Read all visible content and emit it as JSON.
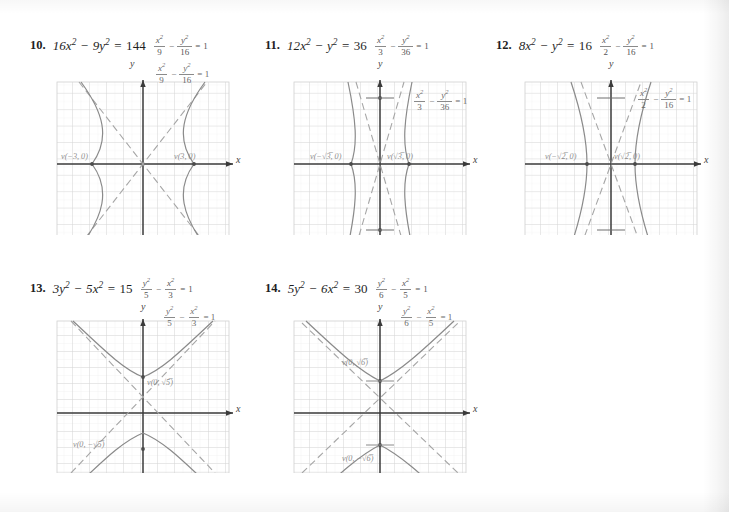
{
  "page": {
    "background": "#ffffff",
    "ink": "#2a2a2a",
    "grid_color": "#d8d8d8",
    "grid_minor_color": "#ececec",
    "curve_color": "#8a8a8a",
    "asymptote_color": "#a6a6a6",
    "axis_color": "#3a3a3a",
    "label_color": "#8d8d8d"
  },
  "problems": [
    {
      "number": "10.",
      "equation_lhs": "16x",
      "equation_mid": "− 9y",
      "equation_rhs": "= 144",
      "equation_full": "16x² − 9y² = 144",
      "standard_form": {
        "num1": "x²",
        "den1": "9",
        "num2": "y²",
        "den2": "16",
        "rhs": "1",
        "text": "x²/9 − y²/16 = 1"
      },
      "graph": {
        "orientation": "horizontal",
        "a": 3,
        "b": 4,
        "x_axis_label": "x",
        "y_axis_label": "y",
        "vertex_left_label": "v(−3, 0)",
        "vertex_right_label": "v(3, 0)",
        "xrange": [
          -5,
          5
        ],
        "yrange": [
          -5,
          5
        ]
      }
    },
    {
      "number": "11.",
      "equation_full": "12x² − y² = 36",
      "standard_form": {
        "num1": "x²",
        "den1": "3",
        "num2": "y²",
        "den2": "36",
        "rhs": "1",
        "text": "x²/3 − y²/36 = 1"
      },
      "graph": {
        "orientation": "horizontal",
        "a": 1.732,
        "b": 6,
        "x_axis_label": "x",
        "y_axis_label": "y",
        "vertex_left_label": "v(−√3, 0)",
        "vertex_right_label": "v(√3, 0)",
        "xrange": [
          -5,
          5
        ],
        "yrange": [
          -5,
          5
        ]
      }
    },
    {
      "number": "12.",
      "equation_full": "8x² − y² = 16",
      "standard_form": {
        "num1": "x²",
        "den1": "2",
        "num2": "y²",
        "den2": "16",
        "rhs": "1",
        "text": "x²/2 − y²/16 = 1"
      },
      "graph": {
        "orientation": "horizontal",
        "a": 1.414,
        "b": 4,
        "x_axis_label": "x",
        "y_axis_label": "y",
        "vertex_left_label": "v(−√2, 0)",
        "vertex_right_label": "v(√2, 0)",
        "xrange": [
          -5,
          5
        ],
        "yrange": [
          -5,
          5
        ]
      }
    },
    {
      "number": "13.",
      "equation_full": "3y² − 5x² = 15",
      "standard_form": {
        "num1": "y²",
        "den1": "5",
        "num2": "x²",
        "den2": "3",
        "rhs": "1",
        "text": "y²/5 − x²/3 = 1"
      },
      "graph": {
        "orientation": "vertical",
        "a": 2.236,
        "b": 1.732,
        "x_axis_label": "x",
        "y_axis_label": "y",
        "vertex_top_label": "v(0, √5)",
        "vertex_bottom_label": "v(0, −√5)",
        "xrange": [
          -5,
          5
        ],
        "yrange": [
          -5,
          5
        ]
      }
    },
    {
      "number": "14.",
      "equation_full": "5y² − 6x² = 30",
      "standard_form": {
        "num1": "y²",
        "den1": "6",
        "num2": "x²",
        "den2": "5",
        "rhs": "1",
        "text": "y²/6 − x²/5 = 1"
      },
      "graph": {
        "orientation": "vertical",
        "a": 2.449,
        "b": 2.236,
        "x_axis_label": "x",
        "y_axis_label": "y",
        "vertex_top_label": "v(0, √6)",
        "vertex_bottom_label": "v(0, −√6)",
        "xrange": [
          -5,
          5
        ],
        "yrange": [
          -5,
          5
        ]
      }
    }
  ]
}
